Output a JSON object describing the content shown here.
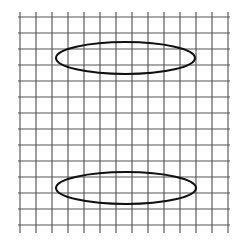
{
  "figure": {
    "title": "Two ellipses on a square grid",
    "background_color": "#ffffff",
    "width": 248,
    "height": 242
  },
  "chart_data": {
    "type": "scatter",
    "title": "Two ellipses on a square grid",
    "subtitle": "",
    "xlabel": "",
    "ylabel": "",
    "xlim": [
      0,
      13
    ],
    "ylim": [
      0,
      12
    ],
    "grid": true,
    "legend_position": "none",
    "tick_labels": {
      "x": [],
      "y": []
    },
    "annotations": [],
    "series": [
      {
        "name": "upper-ellipse",
        "shape": "ellipse",
        "center_x": 125.5,
        "center_y": 58,
        "radius_x": 69.5,
        "radius_y": 16,
        "stroke": "#101010",
        "stroke_width": 2.1,
        "fill": "none"
      },
      {
        "name": "lower-ellipse",
        "shape": "ellipse",
        "center_x": 126,
        "center_y": 188,
        "radius_x": 70,
        "radius_y": 16,
        "stroke": "#101010",
        "stroke_width": 2.1,
        "fill": "none"
      }
    ]
  },
  "grid": {
    "line_color": "#555555",
    "line_width": 1.15,
    "origin_x": 20,
    "origin_y": 17,
    "cell_width": 16,
    "cell_height": 16,
    "vertical_line_count": 14,
    "horizontal_line_count": 14,
    "vertical_overhang_top": 5,
    "vertical_overhang_bottom": 8
  }
}
